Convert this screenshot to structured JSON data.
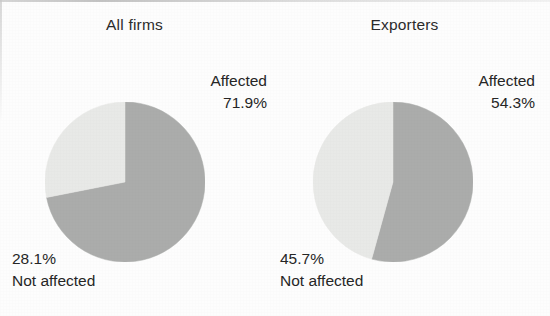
{
  "figure": {
    "background_color": "#fdfdfd",
    "text_color": "#262626"
  },
  "colors": {
    "affected_slice": "#abacab",
    "not_affected_slice": "#e8e9e7"
  },
  "panels": [
    {
      "title": "All firms",
      "affected_label": "Affected",
      "affected_value": "71.9%",
      "not_affected_value": "28.1%",
      "not_affected_label": "Not affected"
    },
    {
      "title": "Exporters",
      "affected_label": "Affected",
      "affected_value": "54.3%",
      "not_affected_value": "45.7%",
      "not_affected_label": "Not affected"
    }
  ],
  "chart_data": [
    {
      "type": "pie",
      "title": "All firms",
      "categories": [
        "Affected",
        "Not affected"
      ],
      "values": [
        71.9,
        28.1
      ],
      "value_labels": [
        "71.9%",
        "45.7%"
      ],
      "colors": [
        "#abacab",
        "#e8e9e7"
      ],
      "start_angle_deg": 0,
      "direction": "clockwise",
      "legend": "none",
      "grid": false,
      "xlabel": "",
      "ylabel": ""
    },
    {
      "type": "pie",
      "title": "Exporters",
      "categories": [
        "Affected",
        "Not affected"
      ],
      "values": [
        54.3,
        45.7
      ],
      "value_labels": [
        "54.3%",
        "45.7%"
      ],
      "colors": [
        "#abacab",
        "#e8e9e7"
      ],
      "start_angle_deg": 0,
      "direction": "clockwise",
      "legend": "none",
      "grid": false,
      "xlabel": "",
      "ylabel": ""
    }
  ]
}
